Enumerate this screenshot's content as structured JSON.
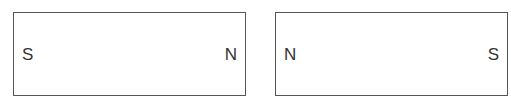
{
  "magnets": [
    {
      "left_pole": "S",
      "right_pole": "N"
    },
    {
      "left_pole": "N",
      "right_pole": "S"
    }
  ],
  "colors": {
    "border": "#555555",
    "text": "#333333",
    "background": "#ffffff"
  }
}
